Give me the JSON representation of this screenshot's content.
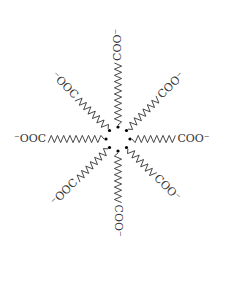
{
  "diagram": {
    "center": {
      "x": 118,
      "y": 139
    },
    "chains": [
      {
        "id": "up",
        "angle": -90,
        "label": "COO⁻",
        "zigzags": 10
      },
      {
        "id": "up-right",
        "angle": -45,
        "label": "COO⁻",
        "zigzags": 7
      },
      {
        "id": "right",
        "angle": 0,
        "label": "COO⁻",
        "zigzags": 7
      },
      {
        "id": "down-right",
        "angle": 45,
        "label": "COO⁻",
        "zigzags": 6
      },
      {
        "id": "down",
        "angle": 90,
        "label": "COO⁻",
        "zigzags": 8
      },
      {
        "id": "down-left",
        "angle": 135,
        "label": "⁻OOC",
        "zigzags": 7
      },
      {
        "id": "left",
        "angle": 180,
        "label": "⁻OOC",
        "zigzags": 9
      },
      {
        "id": "up-left",
        "angle": -135,
        "label": "⁻OOC",
        "zigzags": 7
      }
    ],
    "colors": {
      "line": "#333333",
      "dot": "#000000",
      "background": "#ffffff"
    }
  }
}
